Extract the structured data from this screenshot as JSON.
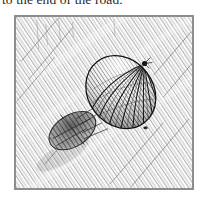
{
  "page": {
    "background_color": "#ffffff",
    "width": 208,
    "height": 199
  },
  "caption": {
    "text": "to the end of the road.",
    "color": "#2a2a2a",
    "clipped_at_top": "true"
  },
  "illustration": {
    "title": "hot-air-balloon-sketch",
    "medium": "pen-and-ink hatching",
    "frame": {
      "border_color": "#8d8d8d",
      "border_width_px": 1,
      "x": 14,
      "y": 15,
      "width": 180,
      "height": 175
    },
    "background": {
      "description": "dense diagonal hatching filling the sky",
      "hatch_angle_deg": 34,
      "hatch_color": "#9a9a9a",
      "paper_color": "#fdfdfd"
    },
    "subjects": [
      {
        "name": "balloon-envelope",
        "description": "tilted ovoid balloon with converging gore lines",
        "center_x": 121,
        "center_y": 92,
        "radius_x": 33,
        "radius_y": 38,
        "tilt_deg": -38,
        "ink_color": "#1e1e1e"
      },
      {
        "name": "balloon-crown",
        "description": "point where gore lines converge at upper right",
        "x": 145,
        "y": 66
      },
      {
        "name": "balloon-basket",
        "description": "dark shadowed mass trailing at lower left",
        "center_x": 72,
        "center_y": 131,
        "ink_color": "#3a3a3a"
      },
      {
        "name": "tether-lines",
        "description": "thin lines running from envelope down to basket"
      },
      {
        "name": "ballast-dot",
        "description": "small dark speck below and right of the balloon",
        "x": 146,
        "y": 128
      }
    ]
  }
}
